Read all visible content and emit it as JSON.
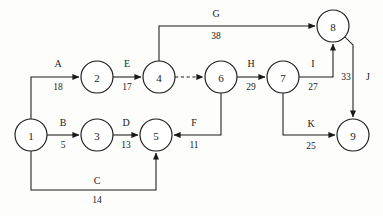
{
  "diagram": {
    "type": "activity-on-arrow-network",
    "title": "",
    "background_color": "#fdfdfc",
    "line_color": "#1a1a1a",
    "nodes": [
      {
        "id": "1",
        "label": "1",
        "cx": 31,
        "cy": 135,
        "r": 16
      },
      {
        "id": "2",
        "label": "2",
        "cx": 97,
        "cy": 77,
        "r": 16
      },
      {
        "id": "3",
        "label": "3",
        "cx": 97,
        "cy": 135,
        "r": 16
      },
      {
        "id": "4",
        "label": "4",
        "cx": 159,
        "cy": 77,
        "r": 16
      },
      {
        "id": "5",
        "label": "5",
        "cx": 156,
        "cy": 135,
        "r": 16
      },
      {
        "id": "6",
        "label": "6",
        "cx": 221,
        "cy": 77,
        "r": 16
      },
      {
        "id": "7",
        "label": "7",
        "cx": 283,
        "cy": 77,
        "r": 16
      },
      {
        "id": "8",
        "label": "8",
        "cx": 333,
        "cy": 26,
        "r": 16
      },
      {
        "id": "9",
        "label": "9",
        "cx": 353,
        "cy": 135,
        "r": 16
      }
    ],
    "edges": [
      {
        "id": "A",
        "name": "A",
        "duration": "18",
        "from": "1",
        "to": "2",
        "path": "M 31 119 L 31 77 L 79 77",
        "name_x": 58,
        "name_y": 67,
        "dur_x": 58,
        "dur_y": 90,
        "dashed": false,
        "arrow": true
      },
      {
        "id": "B",
        "name": "B",
        "duration": "5",
        "from": "1",
        "to": "3",
        "path": "M 47 135 L 79 135",
        "name_x": 63,
        "name_y": 126,
        "dur_x": 63,
        "dur_y": 148,
        "dashed": false,
        "arrow": true
      },
      {
        "id": "C",
        "name": "C",
        "duration": "14",
        "from": "1",
        "to": "5",
        "path": "M 31 151 L 31 190 L 156 190 L 156 153",
        "name_x": 97,
        "name_y": 184,
        "dur_x": 97,
        "dur_y": 203,
        "dashed": false,
        "arrow": true
      },
      {
        "id": "D",
        "name": "D",
        "duration": "13",
        "from": "3",
        "to": "5",
        "path": "M 113 135 L 138 135",
        "name_x": 126,
        "name_y": 126,
        "dur_x": 126,
        "dur_y": 148,
        "dashed": false,
        "arrow": true
      },
      {
        "id": "E",
        "name": "E",
        "duration": "17",
        "from": "2",
        "to": "4",
        "path": "M 113 77 L 141 77",
        "name_x": 127,
        "name_y": 67,
        "dur_x": 127,
        "dur_y": 90,
        "dashed": false,
        "arrow": true
      },
      {
        "id": "dummy",
        "name": "",
        "duration": "",
        "from": "4",
        "to": "6",
        "path": "M 175 77 L 203 77",
        "name_x": 0,
        "name_y": 0,
        "dur_x": 0,
        "dur_y": 0,
        "dashed": true,
        "arrow": true
      },
      {
        "id": "F",
        "name": "F",
        "duration": "11",
        "from": "6",
        "to": "5",
        "path": "M 221 93 L 221 135 L 174 135",
        "name_x": 194,
        "name_y": 126,
        "dur_x": 194,
        "dur_y": 148,
        "dashed": false,
        "arrow": true
      },
      {
        "id": "G",
        "name": "G",
        "duration": "38",
        "from": "4",
        "to": "8",
        "path": "M 159 61 L 159 26 L 315 26",
        "name_x": 216,
        "name_y": 17,
        "dur_x": 216,
        "dur_y": 39,
        "dashed": false,
        "arrow": true
      },
      {
        "id": "H",
        "name": "H",
        "duration": "29",
        "from": "6",
        "to": "7",
        "path": "M 237 77 L 265 77",
        "name_x": 251,
        "name_y": 67,
        "dur_x": 251,
        "dur_y": 90,
        "dashed": false,
        "arrow": true
      },
      {
        "id": "I",
        "name": "I",
        "duration": "27",
        "from": "7",
        "to": "8",
        "path": "M 299 77 L 333 77 L 333 44",
        "name_x": 313,
        "name_y": 67,
        "dur_x": 313,
        "dur_y": 90,
        "dashed": false,
        "arrow": true
      },
      {
        "id": "J",
        "name": "J",
        "duration": "33",
        "from": "8",
        "to": "9",
        "path": "M 345 37 L 353 45 L 353 117",
        "name_x": 368,
        "name_y": 80,
        "dur_x": 346,
        "dur_y": 80,
        "dashed": false,
        "arrow": true
      },
      {
        "id": "K",
        "name": "K",
        "duration": "25",
        "from": "7",
        "to": "9",
        "path": "M 283 93 L 283 135 L 335 135",
        "name_x": 311,
        "name_y": 127,
        "dur_x": 311,
        "dur_y": 149,
        "dashed": false,
        "arrow": true
      }
    ]
  },
  "chart_data": {
    "type": "diagram",
    "nodes": [
      "1",
      "2",
      "3",
      "4",
      "5",
      "6",
      "7",
      "8",
      "9"
    ],
    "activities": [
      {
        "name": "A",
        "from": "1",
        "to": "2",
        "duration": 18
      },
      {
        "name": "B",
        "from": "1",
        "to": "3",
        "duration": 5
      },
      {
        "name": "C",
        "from": "1",
        "to": "5",
        "duration": 14
      },
      {
        "name": "D",
        "from": "3",
        "to": "5",
        "duration": 13
      },
      {
        "name": "E",
        "from": "2",
        "to": "4",
        "duration": 17
      },
      {
        "name": "dummy",
        "from": "4",
        "to": "6",
        "duration": 0
      },
      {
        "name": "F",
        "from": "6",
        "to": "5",
        "duration": 11
      },
      {
        "name": "G",
        "from": "4",
        "to": "8",
        "duration": 38
      },
      {
        "name": "H",
        "from": "6",
        "to": "7",
        "duration": 29
      },
      {
        "name": "I",
        "from": "7",
        "to": "8",
        "duration": 27
      },
      {
        "name": "J",
        "from": "8",
        "to": "9",
        "duration": 33
      },
      {
        "name": "K",
        "from": "7",
        "to": "9",
        "duration": 25
      }
    ]
  }
}
